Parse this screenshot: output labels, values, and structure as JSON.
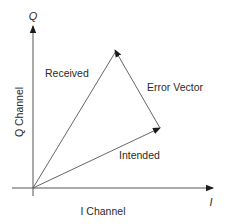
{
  "diagram": {
    "title": "",
    "axes": {
      "x": {
        "symbol": "I",
        "label": "I Channel"
      },
      "y": {
        "symbol": "Q",
        "label": "Q Channel"
      }
    },
    "vectors": {
      "received": {
        "label": "Received"
      },
      "intended": {
        "label": "Intended"
      },
      "error": {
        "label": "Error Vector"
      }
    },
    "colors": {
      "line": "#555555",
      "arrow": "#1a1a1a",
      "text": "#2a2a2a",
      "background": "#ffffff"
    }
  }
}
